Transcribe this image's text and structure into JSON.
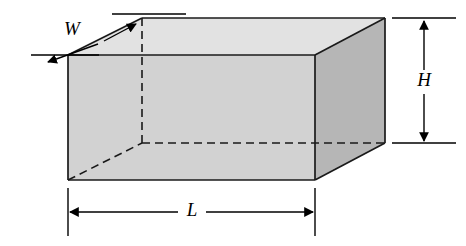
{
  "diagram": {
    "name": "rectangular-box-dimensions",
    "background_color": "#ffffff",
    "labels": {
      "width": "W",
      "height": "H",
      "length": "L"
    },
    "faces": {
      "front": {
        "name": "front-face",
        "fill": "#d2d2d2",
        "points": "68,55 315,55 315,180 68,180"
      },
      "top": {
        "name": "top-face",
        "fill": "#e2e2e2",
        "points": "68,55 142,18 385,18 315,55"
      },
      "right": {
        "name": "right-face",
        "fill": "#b6b6b6",
        "points": "315,55 385,18 385,143 315,180"
      }
    },
    "edges": {
      "stroke": "#1a1a1a",
      "visible_width": 1.6,
      "hidden_width": 1.6,
      "hidden_dash": "8,5",
      "visible": [
        "68,55 315,55",
        "315,55 315,180",
        "315,180 68,180",
        "68,180 68,55",
        "68,55 142,18",
        "142,18 385,18",
        "385,18 315,55",
        "385,18 385,143",
        "385,143 315,180"
      ],
      "hidden": [
        "142,18 142,143",
        "142,143 385,143",
        "68,180 142,143"
      ]
    },
    "dimensions": [
      {
        "id": "width-dimension",
        "label": "W",
        "label_x": 72,
        "label_y": 30,
        "arrow_from": "100,44",
        "arrow_to": "46,63",
        "arrow_from2": "103,42",
        "arrow_to2": "137,23",
        "extension_lines": [
          "31,55 99,55",
          "112,14 186,14"
        ]
      },
      {
        "id": "height-dimension",
        "label": "H",
        "label_x": 424,
        "label_y": 82,
        "arrow_top": "424,20",
        "arrow_bottom": "424,142",
        "extension_lines": [
          "392,18 456,18",
          "392,143 456,143"
        ]
      },
      {
        "id": "length-dimension",
        "label": "L",
        "label_x": 192,
        "label_y": 212,
        "arrow_left": "70,212",
        "arrow_right": "313,212",
        "gap_left": 178,
        "gap_right": 207,
        "extension_lines": [
          "68,188 68,236",
          "315,188 315,236"
        ]
      }
    ]
  }
}
